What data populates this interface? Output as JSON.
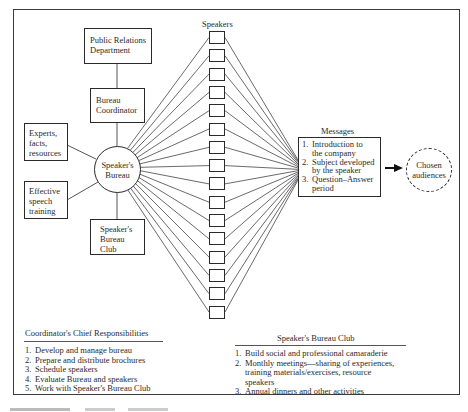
{
  "diagram": {
    "nodes": {
      "public_relations": "Public Relations Department",
      "public_relations_lines": [
        "Public Relations",
        "Department"
      ],
      "bureau_coordinator_lines": [
        "Bureau",
        "Coordinator"
      ],
      "experts_lines": [
        "Experts,",
        "facts,",
        "resources"
      ],
      "speech_training_lines": [
        "Effective",
        "speech",
        "training"
      ],
      "speakers_bureau_lines": [
        "Speaker's",
        "Bureau"
      ],
      "bureau_club_lines": [
        "Speaker's",
        "Bureau",
        "Club"
      ],
      "chosen_audiences_lines": [
        "Chosen",
        "audiences"
      ]
    },
    "speakers": {
      "label": "Speakers",
      "count": 16
    },
    "messages": {
      "label": "Messages",
      "items": [
        {
          "num": "1.",
          "lines": [
            "Introduction to",
            "the company"
          ]
        },
        {
          "num": "2.",
          "lines": [
            "Subject developed",
            "by the speaker"
          ]
        },
        {
          "num": "3.",
          "lines": [
            "Question–Answer",
            "period"
          ]
        }
      ]
    },
    "arrow": "right-arrow"
  },
  "coordinator_responsibilities": {
    "title": "Coordinator's Chief Responsibilities",
    "items": [
      {
        "num": "1.",
        "text": "Develop and manage bureau"
      },
      {
        "num": "2.",
        "text": "Prepare and distribute brochures"
      },
      {
        "num": "3.",
        "text": "Schedule speakers"
      },
      {
        "num": "4.",
        "text": "Evaluate Bureau and speakers"
      },
      {
        "num": "5.",
        "text": "Work with Speaker's Bureau Club"
      }
    ]
  },
  "bureau_club": {
    "title": "Speaker's Bureau Club",
    "items": [
      {
        "num": "1.",
        "lines": [
          "Build social and professional camaraderie"
        ]
      },
      {
        "num": "2.",
        "lines": [
          "Monthly meetings—sharing of experiences,",
          "training materials/exercises, resource",
          "speakers"
        ]
      },
      {
        "num": "3.",
        "lines": [
          "Annual dinners and other activities"
        ]
      }
    ]
  },
  "colors": {
    "line": "#2a2a2a",
    "background": "#ffffff"
  }
}
